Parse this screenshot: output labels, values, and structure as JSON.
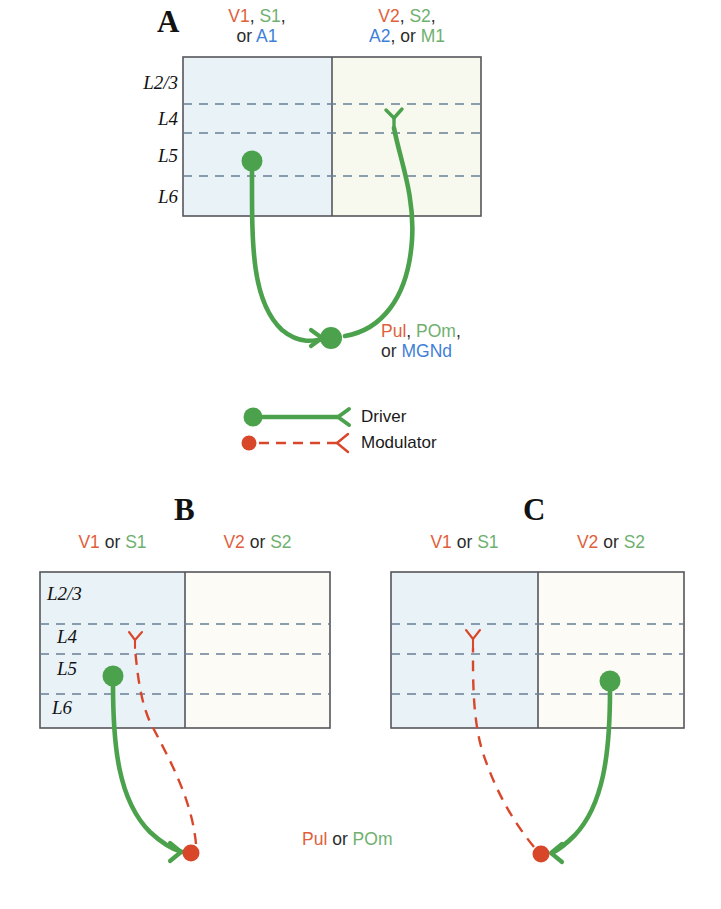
{
  "figure": {
    "background": "#ffffff"
  },
  "colors": {
    "driver_green": "#4ca24c",
    "modulator_red": "#d9472a",
    "text_red": "#e0603c",
    "text_green": "#6fb06f",
    "text_blue": "#3f7fd8",
    "text_dark": "#2b2b2b",
    "box_blue_fill": "#e8f2f7",
    "box_cream_fill": "#f7f8ee",
    "box_stroke": "#55565a",
    "layer_dash": "#6a7f96"
  },
  "panels": {
    "a": {
      "letter": "A",
      "left_area": {
        "line1_parts": [
          "V1",
          ", ",
          "S1",
          ","
        ],
        "line2_parts": [
          "or ",
          "A1"
        ],
        "fill": "#e8f2f7"
      },
      "right_area": {
        "line1_parts": [
          "V2",
          ", ",
          "S2",
          ","
        ],
        "line2_parts": [
          "A2",
          ", or ",
          "M1"
        ],
        "fill": "#f7f8ee"
      },
      "layers": [
        "L2/3",
        "L4",
        "L5",
        "L6"
      ],
      "nucleus": {
        "line1_parts": [
          "Pul",
          ", ",
          "POm",
          ","
        ],
        "line2_parts": [
          "or ",
          "MGNd"
        ]
      },
      "connection": "driver",
      "soma_layer": "L5",
      "soma_side": "left",
      "terminal_layer": "L4",
      "terminal_side": "right"
    },
    "b": {
      "letter": "B",
      "left_area": {
        "parts": [
          "V1",
          " or ",
          "S1"
        ],
        "fill": "#e8f2f7"
      },
      "right_area": {
        "parts": [
          "V2",
          " or ",
          "S2"
        ],
        "fill": "#fcfbf5"
      },
      "layers": [
        "L2/3",
        "L4",
        "L5",
        "L6"
      ],
      "driver_soma_layer": "L5",
      "driver_soma_side": "left",
      "modulator_terminal_layer": "L4",
      "modulator_terminal_side": "left"
    },
    "c": {
      "letter": "C",
      "left_area": {
        "parts": [
          "V1",
          " or ",
          "S1"
        ],
        "fill": "#e8f2f7"
      },
      "right_area": {
        "parts": [
          "V2",
          " or ",
          "S2"
        ],
        "fill": "#fcfbf5"
      },
      "layers": [],
      "driver_soma_layer": "L5",
      "driver_soma_side": "right",
      "modulator_terminal_layer": "L4",
      "modulator_terminal_side": "left"
    },
    "bc_nucleus": {
      "parts": [
        "Pul",
        " or ",
        "POm"
      ]
    }
  },
  "legend": {
    "items": [
      {
        "label": "Driver",
        "style": "solid",
        "color": "#4ca24c",
        "marker": "filled-circle"
      },
      {
        "label": "Modulator",
        "style": "dashed",
        "color": "#d9472a",
        "marker": "filled-circle"
      }
    ]
  },
  "text": {
    "a_letter": "A",
    "b_letter": "B",
    "c_letter": "C",
    "v1": "V1",
    "v2": "V2",
    "s1": "S1",
    "s2": "S2",
    "a1": "A1",
    "a2": "A2",
    "m1": "M1",
    "comma_space": ", ",
    "comma": ",",
    "or_lead": "or ",
    "or_mid": " or ",
    "or_comma": ", or ",
    "pul": "Pul",
    "pom": "POm",
    "mgnd": "MGNd",
    "l23": "L2/3",
    "l4": "L4",
    "l5": "L5",
    "l6": "L6",
    "driver": "Driver",
    "modulator": "Modulator"
  }
}
